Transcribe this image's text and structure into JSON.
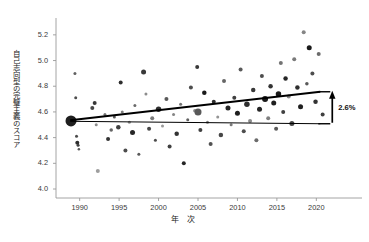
{
  "chart_data": {
    "type": "scatter",
    "title": "",
    "xlabel": "年 次",
    "ylabel": "自己志向型の完璧主義のスコア",
    "xlim": [
      1987,
      2023
    ],
    "ylim": [
      3.93,
      5.3
    ],
    "xticks": [
      1990,
      1995,
      2000,
      2005,
      2010,
      2015,
      2020
    ],
    "yticks": [
      "4.0",
      "4.2",
      "4.4",
      "4.6",
      "4.8",
      "5.0",
      "5.2"
    ],
    "grid": false,
    "legend": null,
    "annotations": [
      {
        "text": "2.6%",
        "x": 2022,
        "y": 4.64,
        "kind": "bracket-arrow-up"
      }
    ],
    "series": [
      {
        "name": "trend-line",
        "type": "line",
        "style": "thick-solid-black",
        "x": [
          1988.8,
          2020.5
        ],
        "y": [
          4.535,
          4.757
        ]
      },
      {
        "name": "reference-line",
        "type": "line",
        "style": "thin-solid-black",
        "x": [
          1988.8,
          2020.5
        ],
        "y": [
          4.527,
          4.508
        ]
      },
      {
        "name": "study-samples",
        "type": "scatter",
        "note": "marker size = sample weight, gray level varies",
        "points": [
          {
            "x": 1988.9,
            "y": 4.53,
            "s": 11,
            "g": 0.12
          },
          {
            "x": 1989.4,
            "y": 4.9,
            "s": 3,
            "g": 0.38
          },
          {
            "x": 1989.5,
            "y": 4.71,
            "s": 3,
            "g": 0.3
          },
          {
            "x": 1989.6,
            "y": 4.41,
            "s": 3,
            "g": 0.3
          },
          {
            "x": 1989.7,
            "y": 4.36,
            "s": 4,
            "g": 0.18
          },
          {
            "x": 1989.8,
            "y": 4.34,
            "s": 3,
            "g": 0.25
          },
          {
            "x": 1989.9,
            "y": 4.31,
            "s": 2.5,
            "g": 0.35
          },
          {
            "x": 1991.6,
            "y": 4.63,
            "s": 4,
            "g": 0.28
          },
          {
            "x": 1991.9,
            "y": 4.67,
            "s": 4,
            "g": 0.22
          },
          {
            "x": 1992.1,
            "y": 4.5,
            "s": 3,
            "g": 0.55
          },
          {
            "x": 1992.3,
            "y": 4.14,
            "s": 4,
            "g": 0.62
          },
          {
            "x": 1993.2,
            "y": 4.58,
            "s": 3,
            "g": 0.45
          },
          {
            "x": 1993.6,
            "y": 4.39,
            "s": 4,
            "g": 0.2
          },
          {
            "x": 1994.0,
            "y": 4.46,
            "s": 3.5,
            "g": 0.4
          },
          {
            "x": 1994.4,
            "y": 4.56,
            "s": 3,
            "g": 0.35
          },
          {
            "x": 1994.9,
            "y": 4.48,
            "s": 4.5,
            "g": 0.25
          },
          {
            "x": 1995.2,
            "y": 4.83,
            "s": 4,
            "g": 0.18
          },
          {
            "x": 1995.4,
            "y": 4.6,
            "s": 3,
            "g": 0.5
          },
          {
            "x": 1995.8,
            "y": 4.3,
            "s": 4,
            "g": 0.3
          },
          {
            "x": 1996.3,
            "y": 4.52,
            "s": 3,
            "g": 0.58
          },
          {
            "x": 1996.7,
            "y": 4.44,
            "s": 5,
            "g": 0.15
          },
          {
            "x": 1997.0,
            "y": 4.65,
            "s": 3,
            "g": 0.42
          },
          {
            "x": 1997.5,
            "y": 4.27,
            "s": 3,
            "g": 0.35
          },
          {
            "x": 1998.1,
            "y": 4.91,
            "s": 5,
            "g": 0.22
          },
          {
            "x": 1998.4,
            "y": 4.74,
            "s": 3,
            "g": 0.55
          },
          {
            "x": 1998.8,
            "y": 4.47,
            "s": 4,
            "g": 0.28
          },
          {
            "x": 1999.2,
            "y": 4.55,
            "s": 4,
            "g": 0.48
          },
          {
            "x": 1999.6,
            "y": 4.38,
            "s": 3,
            "g": 0.3
          },
          {
            "x": 2000.0,
            "y": 4.62,
            "s": 5.5,
            "g": 0.18
          },
          {
            "x": 2000.5,
            "y": 4.49,
            "s": 3,
            "g": 0.6
          },
          {
            "x": 2001.0,
            "y": 4.7,
            "s": 4,
            "g": 0.35
          },
          {
            "x": 2001.4,
            "y": 4.33,
            "s": 4,
            "g": 0.25
          },
          {
            "x": 2001.9,
            "y": 4.58,
            "s": 3,
            "g": 0.52
          },
          {
            "x": 2002.3,
            "y": 4.43,
            "s": 4.5,
            "g": 0.2
          },
          {
            "x": 2002.8,
            "y": 4.66,
            "s": 3,
            "g": 0.45
          },
          {
            "x": 2003.2,
            "y": 4.2,
            "s": 4,
            "g": 0.15
          },
          {
            "x": 2003.7,
            "y": 4.54,
            "s": 3,
            "g": 0.38
          },
          {
            "x": 2004.1,
            "y": 4.79,
            "s": 4,
            "g": 0.3
          },
          {
            "x": 2004.6,
            "y": 4.61,
            "s": 3.5,
            "g": 0.55
          },
          {
            "x": 2004.9,
            "y": 4.95,
            "s": 4,
            "g": 0.22
          },
          {
            "x": 2005.0,
            "y": 4.6,
            "s": 7,
            "g": 0.35
          },
          {
            "x": 2005.3,
            "y": 4.46,
            "s": 4,
            "g": 0.25
          },
          {
            "x": 2005.8,
            "y": 4.75,
            "s": 4.5,
            "g": 0.1
          },
          {
            "x": 2006.2,
            "y": 4.52,
            "s": 3,
            "g": 0.5
          },
          {
            "x": 2006.6,
            "y": 4.35,
            "s": 4,
            "g": 0.32
          },
          {
            "x": 2007.0,
            "y": 4.68,
            "s": 4,
            "g": 0.18
          },
          {
            "x": 2007.5,
            "y": 4.56,
            "s": 3,
            "g": 0.58
          },
          {
            "x": 2007.9,
            "y": 4.42,
            "s": 4.5,
            "g": 0.28
          },
          {
            "x": 2008.3,
            "y": 4.84,
            "s": 4,
            "g": 0.4
          },
          {
            "x": 2008.8,
            "y": 4.63,
            "s": 5,
            "g": 0.15
          },
          {
            "x": 2009.2,
            "y": 4.5,
            "s": 3,
            "g": 0.48
          },
          {
            "x": 2009.6,
            "y": 4.71,
            "s": 4,
            "g": 0.25
          },
          {
            "x": 2010.0,
            "y": 4.59,
            "s": 5,
            "g": 0.12
          },
          {
            "x": 2010.4,
            "y": 4.93,
            "s": 4,
            "g": 0.35
          },
          {
            "x": 2010.8,
            "y": 4.45,
            "s": 4,
            "g": 0.3
          },
          {
            "x": 2011.2,
            "y": 4.66,
            "s": 5.5,
            "g": 0.18
          },
          {
            "x": 2011.6,
            "y": 4.53,
            "s": 4,
            "g": 0.55
          },
          {
            "x": 2012.0,
            "y": 4.77,
            "s": 4.5,
            "g": 0.22
          },
          {
            "x": 2012.4,
            "y": 4.38,
            "s": 4,
            "g": 0.42
          },
          {
            "x": 2012.8,
            "y": 4.62,
            "s": 5,
            "g": 0.15
          },
          {
            "x": 2013.1,
            "y": 4.88,
            "s": 4,
            "g": 0.3
          },
          {
            "x": 2013.5,
            "y": 4.7,
            "s": 6,
            "g": 0.1
          },
          {
            "x": 2013.9,
            "y": 4.55,
            "s": 4,
            "g": 0.5
          },
          {
            "x": 2014.2,
            "y": 4.8,
            "s": 4.5,
            "g": 0.2
          },
          {
            "x": 2014.6,
            "y": 4.67,
            "s": 5,
            "g": 0.12
          },
          {
            "x": 2014.9,
            "y": 4.47,
            "s": 4,
            "g": 0.35
          },
          {
            "x": 2015.2,
            "y": 4.74,
            "s": 5.5,
            "g": 0.1
          },
          {
            "x": 2015.5,
            "y": 4.98,
            "s": 4,
            "g": 0.45
          },
          {
            "x": 2015.8,
            "y": 4.6,
            "s": 4,
            "g": 0.25
          },
          {
            "x": 2016.1,
            "y": 4.86,
            "s": 4.5,
            "g": 0.15
          },
          {
            "x": 2016.5,
            "y": 4.72,
            "s": 4,
            "g": 0.55
          },
          {
            "x": 2016.9,
            "y": 4.51,
            "s": 5,
            "g": 0.28
          },
          {
            "x": 2017.2,
            "y": 5.01,
            "s": 4,
            "g": 0.48
          },
          {
            "x": 2017.6,
            "y": 4.79,
            "s": 4.5,
            "g": 0.18
          },
          {
            "x": 2018.0,
            "y": 4.64,
            "s": 5,
            "g": 0.12
          },
          {
            "x": 2018.4,
            "y": 5.22,
            "s": 4,
            "g": 0.52
          },
          {
            "x": 2018.8,
            "y": 4.82,
            "s": 3.5,
            "g": 0.35
          },
          {
            "x": 2019.1,
            "y": 5.1,
            "s": 5,
            "g": 0.1
          },
          {
            "x": 2019.5,
            "y": 4.9,
            "s": 4,
            "g": 0.3
          },
          {
            "x": 2019.9,
            "y": 4.68,
            "s": 4.5,
            "g": 0.2
          },
          {
            "x": 2020.3,
            "y": 5.05,
            "s": 4,
            "g": 0.42
          },
          {
            "x": 2020.8,
            "y": 4.58,
            "s": 4,
            "g": 0.25
          }
        ]
      }
    ]
  },
  "axis": {
    "line_color": "#999999",
    "tick_color": "#3a3a3a"
  }
}
